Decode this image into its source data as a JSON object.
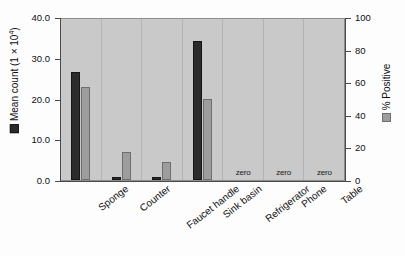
{
  "chart_data": {
    "type": "bar",
    "title": "",
    "subtitle": "",
    "xlabel": "",
    "categories": [
      "Sponge",
      "Counter",
      "Faucet handle",
      "Sink basin",
      "Refrigerator",
      "Phone",
      "Table"
    ],
    "series": [
      {
        "name": "Mean count (1 x 10⁴)",
        "axis": "left",
        "color": "#2b2b2b",
        "values": [
          26.6,
          0.5,
          0.6,
          34.2,
          0,
          0,
          0
        ]
      },
      {
        "name": "% Positive",
        "axis": "right",
        "color": "#9d9d9d",
        "values": [
          57,
          17,
          11,
          50,
          0,
          0,
          0
        ]
      }
    ],
    "left_axis": {
      "label_prefix": "Mean count (1 × 10",
      "label_sup": "4",
      "label_suffix": ")",
      "ylim": [
        0,
        40
      ],
      "ticks": [
        "0.0",
        "10.0",
        "20.0",
        "30.0",
        "40.0"
      ],
      "tick_values": [
        0,
        10,
        20,
        30,
        40
      ]
    },
    "right_axis": {
      "label": "% Positive",
      "ylim": [
        0,
        100
      ],
      "ticks": [
        "0",
        "20",
        "40",
        "60",
        "80",
        "100"
      ],
      "tick_values": [
        0,
        20,
        40,
        60,
        80,
        100
      ]
    },
    "annotations": [
      {
        "category": "Refrigerator",
        "text": "zero"
      },
      {
        "category": "Phone",
        "text": "zero"
      },
      {
        "category": "Table",
        "text": "zero"
      }
    ],
    "grid": false,
    "legend_position": "axis-titles",
    "plot_background": "#c9c9c9",
    "page_background": "#fdfdfd"
  }
}
